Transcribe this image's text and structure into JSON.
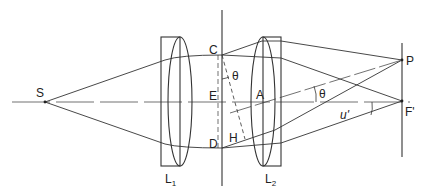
{
  "figure": {
    "type": "optical ray diagram",
    "labels": {
      "source": "S",
      "lens1": "L",
      "lens1_sub": "1",
      "lens2": "L",
      "lens2_sub": "2",
      "point_c": "C",
      "point_e": "E",
      "point_d": "D",
      "point_h": "H",
      "point_a": "A",
      "angle_theta_1": "θ",
      "angle_theta_2": "θ",
      "angle_u_prime": "u'",
      "image_point_p": "P",
      "focal_point": "F'"
    }
  }
}
